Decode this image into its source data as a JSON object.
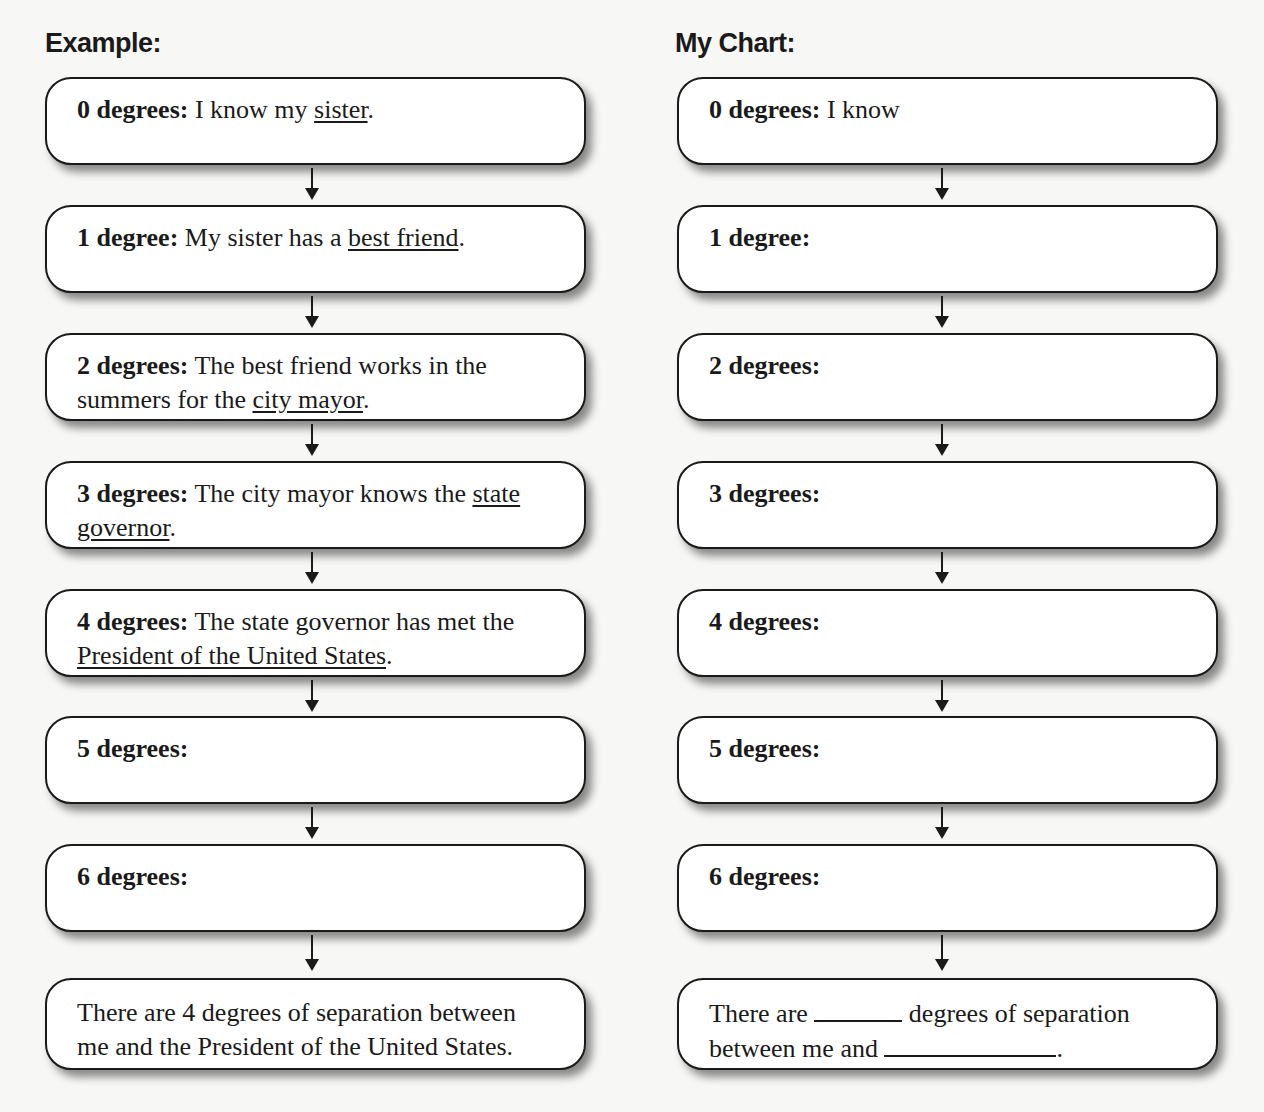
{
  "example": {
    "heading": "Example:",
    "steps": [
      {
        "label": "0 degrees:",
        "pre": " I know my ",
        "link": "sister",
        "post": "."
      },
      {
        "label": "1 degree:",
        "pre": " My sister has a ",
        "link": "best friend",
        "post": "."
      },
      {
        "label": "2 degrees:",
        "pre": " The best friend works in the summers for the ",
        "link": "city mayor",
        "post": "."
      },
      {
        "label": "3 degrees:",
        "pre": " The city mayor knows the ",
        "link": "state governor",
        "post": "."
      },
      {
        "label": "4 degrees:",
        "pre": " The state governor has met the ",
        "link": "President of the United States",
        "post": "."
      },
      {
        "label": "5 degrees:",
        "pre": "",
        "link": "",
        "post": ""
      },
      {
        "label": "6 degrees:",
        "pre": "",
        "link": "",
        "post": ""
      }
    ],
    "conclusion": "There are 4 degrees of separation between me and the President of the United States."
  },
  "my_chart": {
    "heading": "My Chart:",
    "steps": [
      {
        "label": "0 degrees:",
        "text": " I know"
      },
      {
        "label": "1 degree:",
        "text": ""
      },
      {
        "label": "2 degrees:",
        "text": ""
      },
      {
        "label": "3 degrees:",
        "text": ""
      },
      {
        "label": "4 degrees:",
        "text": ""
      },
      {
        "label": "5 degrees:",
        "text": ""
      },
      {
        "label": "6 degrees:",
        "text": ""
      }
    ],
    "conclusion": {
      "part1": "There are ",
      "part2": " degrees of separation between me and ",
      "part3": "."
    }
  }
}
